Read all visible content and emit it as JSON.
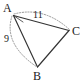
{
  "figure": {
    "kind": "geometry-triangle-diagram",
    "width": 83,
    "height": 81,
    "background_color": "#ffffff",
    "stroke_color": "#333333",
    "dashed_stroke_color": "#8a8a8a",
    "label_color": "#1a1a1a"
  },
  "vertices": [
    {
      "id": "A",
      "label": "A",
      "x": 13,
      "y": 15
    },
    {
      "id": "B",
      "label": "B",
      "x": 38,
      "y": 68
    },
    {
      "id": "C",
      "label": "C",
      "x": 70,
      "y": 31
    }
  ],
  "edges": [
    {
      "id": "AC",
      "from": "A",
      "to": "C",
      "style": "solid",
      "label": "11"
    },
    {
      "id": "AB",
      "from": "A",
      "to": "B",
      "style": "solid",
      "label": ""
    },
    {
      "id": "BC",
      "from": "B",
      "to": "C",
      "style": "solid",
      "label": ""
    }
  ],
  "arcs": [
    {
      "id": "arc-ac",
      "from": "A",
      "to": "C",
      "style": "dotted",
      "bulge": "above"
    },
    {
      "id": "arc-ab",
      "from": "A",
      "to": "B",
      "style": "dotted",
      "bulge": "left"
    }
  ],
  "edge_labels": {
    "ac": "11",
    "ab": "9"
  }
}
